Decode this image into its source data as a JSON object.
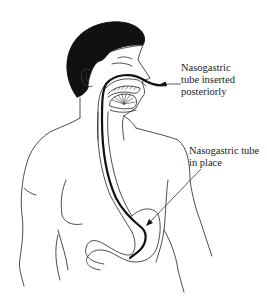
{
  "labels": {
    "inserted": {
      "lines": [
        "Nasogastric",
        "tube inserted",
        "posteriorly"
      ]
    },
    "in_place": {
      "lines": [
        "Nasogastric tube",
        "in place"
      ]
    }
  },
  "colors": {
    "line": "#3a3a3a",
    "hair": "#111111",
    "tube": "#111111",
    "background": "#ffffff"
  }
}
